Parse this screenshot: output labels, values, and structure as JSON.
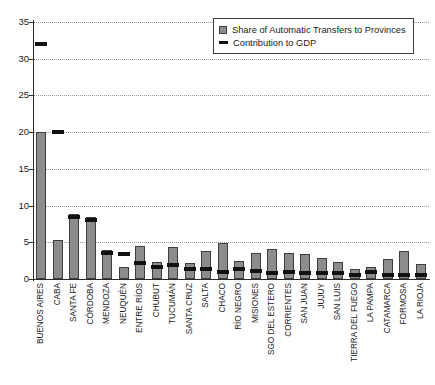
{
  "chart_data": {
    "type": "bar",
    "title": "",
    "subtitle": "",
    "xlabel": "",
    "ylabel": "",
    "ylim": [
      0,
      35
    ],
    "yticks": [
      0,
      5,
      10,
      15,
      20,
      25,
      30,
      35
    ],
    "grid": true,
    "legend_position": "top-right",
    "categories": [
      "BUENOS AIRES",
      "CABA",
      "SANTA FE",
      "CÓRDOBA",
      "MENDOZA",
      "NEUQUÉN",
      "ENTRE RÍOS",
      "CHUBUT",
      "TUCUMÁN",
      "SANTA CRUZ",
      "SALTA",
      "CHACO",
      "RÍO NEGRO",
      "MISIONES",
      "SGO DEL ESTERO",
      "CORRIENTES",
      "SAN JUAN",
      "JUJUY",
      "SAN LUIS",
      "TIERRA DEL FUEGO",
      "LA PAMPA",
      "CATAMARCA",
      "FORMOSA",
      "LA RIOJA"
    ],
    "series": [
      {
        "name": "Share of Automatic Transfers to Provinces",
        "type": "bar",
        "color": "#8c8c8c",
        "values": [
          20.0,
          5.3,
          8.8,
          8.4,
          4.0,
          1.7,
          4.5,
          2.3,
          4.4,
          2.2,
          3.8,
          4.9,
          2.4,
          3.5,
          4.1,
          3.6,
          3.4,
          2.9,
          2.3,
          1.4,
          1.7,
          2.7,
          3.8,
          2.1
        ]
      },
      {
        "name": "Contribution to GDP",
        "type": "marker",
        "color": "#111111",
        "values": [
          32.0,
          20.0,
          8.5,
          8.1,
          3.5,
          3.4,
          2.2,
          1.6,
          1.9,
          1.4,
          1.4,
          1.0,
          1.3,
          1.1,
          0.8,
          0.9,
          0.8,
          0.8,
          0.8,
          0.5,
          0.9,
          0.5,
          0.5,
          0.5
        ]
      }
    ]
  },
  "legend": {
    "items": [
      {
        "label": "Share of Automatic Transfers to Provinces",
        "marker": "bar-swatch"
      },
      {
        "label": "Contribution to GDP",
        "marker": "line-swatch"
      }
    ]
  }
}
